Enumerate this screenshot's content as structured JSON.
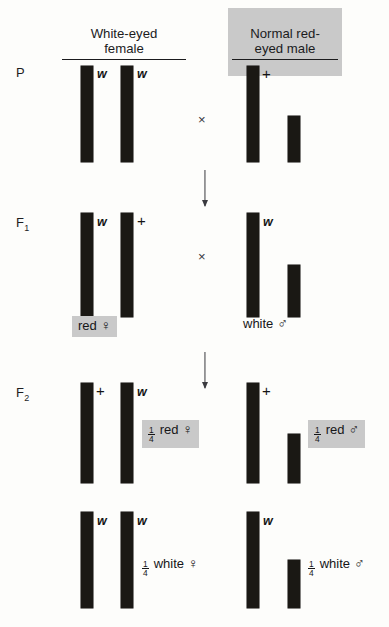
{
  "diagram": {
    "title_female": "White-eyed\nfemale",
    "title_male": "Normal red-\neyed male",
    "generations": {
      "p": "P",
      "f1_main": "F",
      "f1_sub": "1",
      "f2_main": "F",
      "f2_sub": "2"
    },
    "cross_symbol": "×",
    "alleles": {
      "w": "w",
      "plus": "+"
    },
    "symbols": {
      "female": "♀",
      "male": "♂"
    },
    "fraction": {
      "numerator": "1",
      "denominator": "4"
    },
    "phenotypes": {
      "f1_female": "red",
      "f1_male": "white",
      "f2_red_female": "red",
      "f2_red_male": "red",
      "f2_white_female": "white",
      "f2_white_male": "white"
    },
    "colors": {
      "chromosome": "#1a1814",
      "highlight": "#c9c9c9",
      "background": "#fdfdfb",
      "text": "#18181a"
    }
  },
  "rows": {
    "p": {
      "female_alleles": [
        "w",
        "w"
      ],
      "male_alleles": [
        "+"
      ]
    },
    "f1": {
      "female_alleles": [
        "w",
        "+"
      ],
      "male_alleles": [
        "w"
      ]
    },
    "f2_top": {
      "female_alleles": [
        "+",
        "w"
      ],
      "male_alleles": [
        "+"
      ]
    },
    "f2_bottom": {
      "female_alleles": [
        "w",
        "w"
      ],
      "male_alleles": [
        "w"
      ]
    }
  }
}
